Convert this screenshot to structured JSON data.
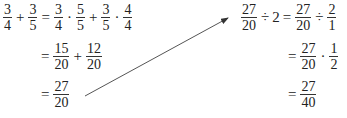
{
  "left": {
    "line1": {
      "lhs": [
        {
          "num": "3",
          "den": "4"
        },
        {
          "op": "+"
        },
        {
          "num": "3",
          "den": "5"
        }
      ],
      "eq": "=",
      "rhs": [
        {
          "num": "3",
          "den": "4"
        },
        {
          "op": "·"
        },
        {
          "num": "5",
          "den": "5"
        },
        {
          "op": "+"
        },
        {
          "num": "3",
          "den": "5"
        },
        {
          "op": "·"
        },
        {
          "num": "4",
          "den": "4"
        }
      ]
    },
    "line2": {
      "eq": "=",
      "rhs": [
        {
          "num": "15",
          "den": "20"
        },
        {
          "op": "+"
        },
        {
          "num": "12",
          "den": "20"
        }
      ]
    },
    "line3": {
      "eq": "=",
      "rhs": [
        {
          "num": "27",
          "den": "20"
        }
      ]
    }
  },
  "right": {
    "line1": {
      "lhs": [
        {
          "num": "27",
          "den": "20"
        },
        {
          "op": "÷"
        },
        {
          "text": "2"
        }
      ],
      "eq": "=",
      "rhs": [
        {
          "num": "27",
          "den": "20"
        },
        {
          "op": "÷"
        },
        {
          "num": "2",
          "den": "1"
        }
      ]
    },
    "line2": {
      "eq": "=",
      "rhs": [
        {
          "num": "27",
          "den": "20"
        },
        {
          "op": "·"
        },
        {
          "num": "1",
          "den": "2"
        }
      ]
    },
    "line3": {
      "eq": "=",
      "rhs": [
        {
          "num": "27",
          "den": "40"
        }
      ]
    }
  },
  "arrow": {
    "from": "left.line3",
    "to": "right.line1",
    "color": "#333333"
  }
}
